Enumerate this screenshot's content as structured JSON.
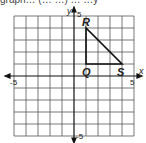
{
  "header": {
    "cutoff_text": "graph… (… …) … …y"
  },
  "graph": {
    "x_axis_label": "x",
    "y_axis_label": "y",
    "ticks": {
      "x_min": "-5",
      "x_max": "5",
      "y_min": "-5",
      "y_max": "5"
    },
    "range": {
      "x": [
        -5,
        5
      ],
      "y": [
        -5,
        5
      ]
    },
    "grid_step": 1,
    "points": [
      {
        "name": "R",
        "x": 1,
        "y": 4
      },
      {
        "name": "Q",
        "x": 1,
        "y": 1
      },
      {
        "name": "S",
        "x": 4,
        "y": 1
      }
    ],
    "shape": "triangle RQS"
  }
}
